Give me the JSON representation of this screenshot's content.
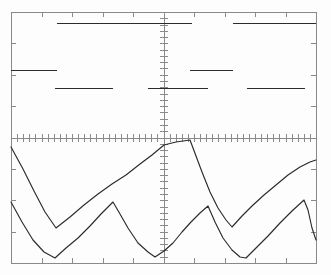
{
  "instrument": {
    "type": "oscilloscope-screen-capture",
    "display_name": "Oscilloscope Display",
    "trace_color": "#2b2b2b",
    "graticule_color": "#8a8a8a",
    "background_color": "#fdfdfd"
  },
  "graticule": {
    "left": 11,
    "top": 12,
    "right": 316,
    "bottom": 263,
    "horizontal_divisions": 10,
    "vertical_divisions": 8,
    "center_x": 164,
    "center_y": 138,
    "border_tick_length": 5,
    "axis_tick_length": 4,
    "subticks_per_division": 5,
    "show_border_ticks": true,
    "show_center_axes": true
  },
  "chart_data": {
    "type": "line",
    "title": "Oscilloscope Display",
    "subtitle": "Dual-trace capture: upper stepped/level traces, lower sawtooth traces",
    "xlabel": "",
    "ylabel": "",
    "xlim": [
      11,
      316
    ],
    "ylim": [
      12,
      263
    ],
    "grid": false,
    "legend": "none",
    "series": [
      {
        "name": "upper-trace-high-level",
        "style": "stepped-level-segments",
        "segments": [
          {
            "x1": 57,
            "x2": 192,
            "y": 23
          },
          {
            "x1": 233,
            "x2": 316,
            "y": 23
          }
        ]
      },
      {
        "name": "upper-trace-mid-level",
        "style": "stepped-level-segments",
        "segments": [
          {
            "x1": 11,
            "x2": 57,
            "y": 70
          },
          {
            "x1": 190,
            "x2": 233,
            "y": 70
          }
        ]
      },
      {
        "name": "upper-trace-low-level",
        "style": "stepped-level-segments",
        "segments": [
          {
            "x1": 55,
            "x2": 113,
            "y": 88
          },
          {
            "x1": 148,
            "x2": 208,
            "y": 88
          },
          {
            "x1": 247,
            "x2": 305,
            "y": 88
          }
        ]
      },
      {
        "name": "lower-trace-a",
        "style": "sawtooth-exponential",
        "description": "Large-amplitude sawtooth: linear fall, concave rise to peak, convex fall",
        "points": [
          [
            11,
            147
          ],
          [
            23,
            169
          ],
          [
            34,
            191
          ],
          [
            45,
            212
          ],
          [
            56,
            228
          ],
          [
            70,
            217
          ],
          [
            84,
            205
          ],
          [
            98,
            194
          ],
          [
            112,
            184
          ],
          [
            126,
            175
          ],
          [
            140,
            164
          ],
          [
            152,
            155
          ],
          [
            164,
            145
          ],
          [
            176,
            142
          ],
          [
            190,
            140
          ],
          [
            196,
            156
          ],
          [
            202,
            172
          ],
          [
            210,
            192
          ],
          [
            218,
            208
          ],
          [
            226,
            220
          ],
          [
            232,
            227
          ],
          [
            242,
            216
          ],
          [
            252,
            206
          ],
          [
            264,
            195
          ],
          [
            276,
            185
          ],
          [
            288,
            175
          ],
          [
            300,
            167
          ],
          [
            310,
            162
          ],
          [
            316,
            160
          ]
        ]
      },
      {
        "name": "lower-trace-b",
        "style": "sawtooth-exponential",
        "description": "Offset sawtooth, same period, lower amplitude baseline",
        "points": [
          [
            11,
            202
          ],
          [
            22,
            222
          ],
          [
            33,
            240
          ],
          [
            44,
            252
          ],
          [
            55,
            258
          ],
          [
            66,
            248
          ],
          [
            78,
            238
          ],
          [
            90,
            226
          ],
          [
            101,
            214
          ],
          [
            113,
            202
          ],
          [
            120,
            214
          ],
          [
            128,
            228
          ],
          [
            138,
            243
          ],
          [
            148,
            252
          ],
          [
            155,
            257
          ],
          [
            164,
            251
          ],
          [
            173,
            243
          ],
          [
            182,
            232
          ],
          [
            191,
            222
          ],
          [
            200,
            213
          ],
          [
            208,
            206
          ],
          [
            215,
            222
          ],
          [
            223,
            238
          ],
          [
            232,
            250
          ],
          [
            240,
            257
          ],
          [
            246,
            258
          ],
          [
            256,
            248
          ],
          [
            268,
            236
          ],
          [
            280,
            223
          ],
          [
            292,
            211
          ],
          [
            304,
            200
          ],
          [
            308,
            210
          ],
          [
            312,
            228
          ],
          [
            316,
            240
          ]
        ]
      }
    ]
  },
  "accessibility": {
    "screen_label": "Oscilloscope graticule display",
    "upper_trace_label": "Upper stepped waveform",
    "lower_trace_label": "Lower sawtooth waveform"
  }
}
